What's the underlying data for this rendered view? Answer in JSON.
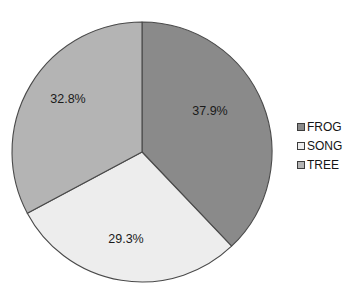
{
  "chart_data": {
    "type": "pie",
    "title": "",
    "categories": [
      "FROG",
      "SONG",
      "TREE"
    ],
    "values": [
      37.9,
      29.3,
      32.8
    ],
    "value_labels": [
      "37.9%",
      "29.3%",
      "32.8%"
    ],
    "units": "percent",
    "start_angle_deg": 0,
    "direction": "clockwise",
    "legend_position": "right",
    "grid": false,
    "colors": [
      "#8a8a8a",
      "#ededed",
      "#b4b4b4"
    ],
    "slice_border_color": "#4a4a4a",
    "label_color": "#1a1a1a",
    "background": "#ffffff",
    "slices": [
      {
        "name": "FROG",
        "value": 37.9,
        "label": "37.9%",
        "color": "#8a8a8a",
        "start_deg": 0,
        "end_deg": 136.44,
        "label_x": 210,
        "label_y": 112
      },
      {
        "name": "SONG",
        "value": 29.3,
        "label": "29.3%",
        "color": "#ededed",
        "start_deg": 136.44,
        "end_deg": 241.92,
        "label_x": 126,
        "label_y": 240
      },
      {
        "name": "TREE",
        "value": 32.8,
        "label": "32.8%",
        "color": "#b4b4b4",
        "start_deg": 241.92,
        "end_deg": 360,
        "label_x": 68,
        "label_y": 100
      }
    ]
  },
  "legend": {
    "items": [
      {
        "label": "FROG",
        "color": "#8a8a8a"
      },
      {
        "label": "SONG",
        "color": "#ededed"
      },
      {
        "label": "TREE",
        "color": "#b4b4b4"
      }
    ]
  }
}
